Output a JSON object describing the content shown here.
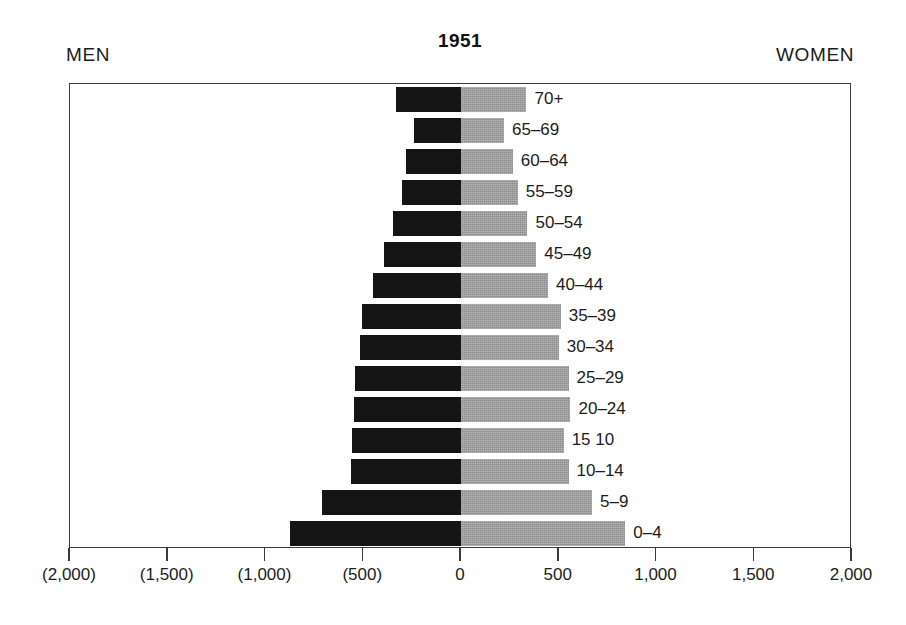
{
  "header": {
    "title": "1951",
    "men_label": "MEN",
    "women_label": "WOMEN"
  },
  "chart_data": {
    "type": "bar",
    "subtype": "population-pyramid",
    "title": "1951",
    "xlabel": "",
    "ylabel": "",
    "grid": false,
    "legend_position": "top-outside",
    "orientation": "horizontal-diverging",
    "xlim": [
      -2000,
      2000
    ],
    "xticks": [
      -2000,
      -1500,
      -1000,
      -500,
      0,
      500,
      1000,
      1500,
      2000
    ],
    "xtick_labels": [
      "(2,000)",
      "(1,500)",
      "(1,000)",
      "(500)",
      "0",
      "500",
      "1,000",
      "1,500",
      "2,000"
    ],
    "categories": [
      "70+",
      "65–69",
      "60–64",
      "55–59",
      "50–54",
      "45–49",
      "40–44",
      "35–39",
      "30–34",
      "25–29",
      "20–24",
      "15 10",
      "10–14",
      "5–9",
      "0–4"
    ],
    "series": [
      {
        "name": "MEN",
        "color": "#141414",
        "side": "left",
        "values": [
          -330,
          -240,
          -280,
          -300,
          -350,
          -395,
          -450,
          -505,
          -515,
          -540,
          -545,
          -555,
          -565,
          -710,
          -875
        ]
      },
      {
        "name": "WOMEN",
        "color": "#9b9b9b",
        "side": "right",
        "values": [
          335,
          220,
          265,
          290,
          340,
          385,
          445,
          510,
          500,
          550,
          560,
          525,
          550,
          670,
          840
        ]
      }
    ]
  },
  "colors": {
    "men_bar": "#141414",
    "women_bar": "#9b9b9b",
    "frame": "#3a3a3a",
    "background": "#ffffff",
    "text": "#1c1c1c"
  }
}
